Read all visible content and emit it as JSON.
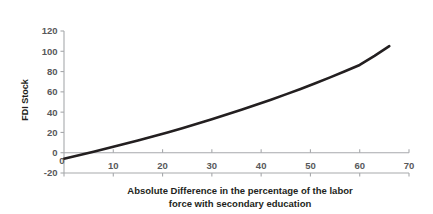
{
  "chart_data": {
    "type": "line",
    "title": "",
    "xlabel": "Absolute Difference in the percentage of the labor force with secondary education",
    "xlabel_line1": "Absolute Difference in the percentage of the labor",
    "xlabel_line2": "force with secondary education",
    "ylabel": "FDI Stock",
    "xlim": [
      0,
      70
    ],
    "ylim": [
      -20,
      120
    ],
    "xticks": [
      0,
      10,
      20,
      30,
      40,
      50,
      60,
      70
    ],
    "xtick_labels": [
      "0",
      "10",
      "20",
      "30",
      "40",
      "50",
      "60",
      "70"
    ],
    "yticks": [
      -20,
      0,
      20,
      40,
      60,
      80,
      100,
      120
    ],
    "ytick_labels": [
      "-20",
      "0",
      "20",
      "40",
      "60",
      "80",
      "100",
      "120"
    ],
    "grid": false,
    "legend": "none",
    "zero_line": true,
    "series": [
      {
        "name": "FDI Stock",
        "color": "#231f20",
        "line_width": 2.6,
        "x": [
          0,
          3,
          6,
          9,
          12,
          15,
          18,
          21,
          24,
          27,
          30,
          33,
          36,
          39,
          42,
          45,
          48,
          51,
          54,
          57,
          60,
          63,
          66
        ],
        "y": [
          -6.0,
          -2.5,
          1.0,
          4.6,
          8.3,
          12.1,
          16.0,
          20.0,
          24.2,
          28.5,
          33.0,
          37.6,
          42.3,
          47.2,
          52.3,
          57.5,
          62.9,
          68.5,
          74.3,
          80.3,
          86.5,
          95.5,
          105.0
        ]
      }
    ]
  },
  "axes": {
    "y_title": "FDI Stock",
    "x_title_line1": "Absolute Difference in the percentage of the labor",
    "x_title_line2": "force with secondary education"
  },
  "colors": {
    "line": "#231f20",
    "axis": "#a7a9ac",
    "tick_text": "#58595b",
    "title_text": "#231f20",
    "background": "#ffffff"
  }
}
